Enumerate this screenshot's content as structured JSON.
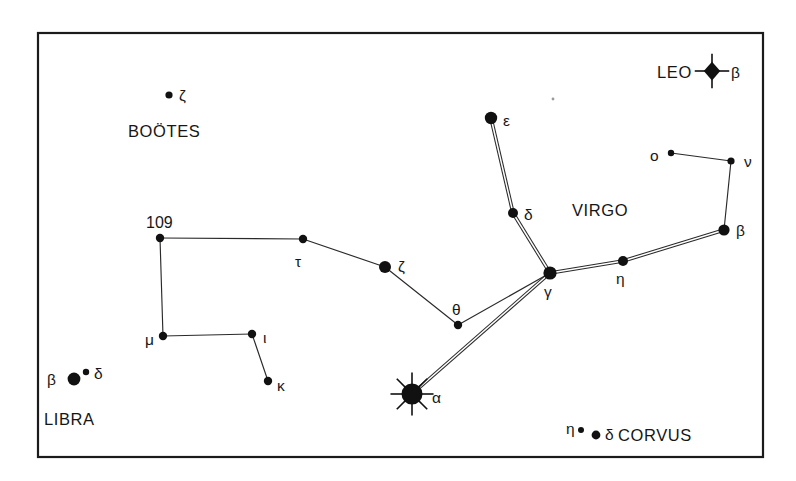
{
  "figure": {
    "kind": "star-chart",
    "title_visible": false,
    "background_color": "#ffffff",
    "frame": {
      "x": 38,
      "y": 33,
      "width": 725,
      "height": 424,
      "stroke_color": "#1b1b1b"
    },
    "ink_color": "#111111"
  },
  "constellation_labels": [
    {
      "id": "leo",
      "text": "LEO",
      "x": 657,
      "y": 78
    },
    {
      "id": "bootes",
      "text": "BOÖTES",
      "x": 128,
      "y": 137
    },
    {
      "id": "virgo",
      "text": "VIRGO",
      "x": 572,
      "y": 216
    },
    {
      "id": "libra",
      "text": "LIBRA",
      "x": 44,
      "y": 425
    },
    {
      "id": "corvus",
      "text": "CORVUS",
      "x": 618,
      "y": 441
    }
  ],
  "stars": [
    {
      "id": "leo-beta",
      "label": "β",
      "label_x": 731,
      "label_y": 78,
      "x": 712,
      "y": 71,
      "marker": "burst4",
      "r": 7.5
    },
    {
      "id": "bootes-zeta",
      "label": "ζ",
      "label_x": 179,
      "label_y": 101,
      "x": 169,
      "y": 95,
      "marker": "dot",
      "r": 3.6
    },
    {
      "id": "virgo-epsilon",
      "label": "ε",
      "label_x": 503,
      "label_y": 126,
      "x": 491,
      "y": 118,
      "marker": "dot",
      "r": 6.2
    },
    {
      "id": "virgo-omicron",
      "label": "ο",
      "label_x": 650,
      "label_y": 161,
      "x": 671,
      "y": 153,
      "marker": "dot",
      "r": 3.2
    },
    {
      "id": "virgo-nu",
      "label": "ν",
      "label_x": 744,
      "label_y": 167,
      "x": 731,
      "y": 161,
      "marker": "dot",
      "r": 3.6
    },
    {
      "id": "virgo-delta",
      "label": "δ",
      "label_x": 524,
      "label_y": 220,
      "x": 513,
      "y": 213,
      "marker": "dot",
      "r": 5.0
    },
    {
      "id": "virgo-beta",
      "label": "β",
      "label_x": 736,
      "label_y": 236,
      "x": 724,
      "y": 230,
      "marker": "dot",
      "r": 5.6
    },
    {
      "id": "bootes-109",
      "label": "109",
      "label_x": 146,
      "label_y": 228,
      "x": 160,
      "y": 238,
      "marker": "dot",
      "r": 4.2
    },
    {
      "id": "bootes-tau",
      "label": "τ",
      "label_x": 295,
      "label_y": 267,
      "x": 303,
      "y": 239,
      "marker": "dot",
      "r": 4.2
    },
    {
      "id": "bootes-zeta2",
      "label": "ζ",
      "label_x": 398,
      "label_y": 272,
      "x": 385,
      "y": 267,
      "marker": "dot",
      "r": 6.0
    },
    {
      "id": "virgo-gamma",
      "label": "γ",
      "label_x": 544,
      "label_y": 297,
      "x": 550,
      "y": 273,
      "marker": "dot",
      "r": 6.6
    },
    {
      "id": "virgo-eta",
      "label": "η",
      "label_x": 616,
      "label_y": 284,
      "x": 623,
      "y": 261,
      "marker": "dot",
      "r": 5.0
    },
    {
      "id": "bootes-theta",
      "label": "θ",
      "label_x": 452,
      "label_y": 315,
      "x": 458,
      "y": 325,
      "marker": "dot",
      "r": 4.2
    },
    {
      "id": "bootes-mu",
      "label": "μ",
      "label_x": 145,
      "label_y": 345,
      "x": 163,
      "y": 336,
      "marker": "dot",
      "r": 4.2
    },
    {
      "id": "bootes-iota",
      "label": "ι",
      "label_x": 263,
      "label_y": 343,
      "x": 252,
      "y": 334,
      "marker": "dot",
      "r": 4.2
    },
    {
      "id": "bootes-kappa",
      "label": "κ",
      "label_x": 277,
      "label_y": 391,
      "x": 268,
      "y": 381,
      "marker": "dot",
      "r": 4.2
    },
    {
      "id": "libra-beta",
      "label": "β",
      "label_x": 47,
      "label_y": 385,
      "x": 74,
      "y": 379,
      "marker": "dot",
      "r": 6.4
    },
    {
      "id": "libra-delta",
      "label": "δ",
      "label_x": 94,
      "label_y": 379,
      "x": 86,
      "y": 372,
      "marker": "dot",
      "r": 3.2
    },
    {
      "id": "virgo-alpha",
      "label": "α",
      "label_x": 432,
      "label_y": 403,
      "x": 412,
      "y": 394,
      "marker": "burst8",
      "r": 10.5
    },
    {
      "id": "corvus-eta",
      "label": "η",
      "label_x": 566,
      "label_y": 434,
      "x": 581,
      "y": 430,
      "marker": "dot",
      "r": 3.0
    },
    {
      "id": "corvus-delta",
      "label": "δ",
      "label_x": 605,
      "label_y": 440,
      "x": 596,
      "y": 435,
      "marker": "dot",
      "r": 4.4
    }
  ],
  "links": [
    {
      "id": "epsilon-delta",
      "from": "virgo-epsilon",
      "to": "virgo-delta",
      "style": "double"
    },
    {
      "id": "delta-gamma",
      "from": "virgo-delta",
      "to": "virgo-gamma",
      "style": "double"
    },
    {
      "id": "gamma-eta",
      "from": "virgo-gamma",
      "to": "virgo-eta",
      "style": "double"
    },
    {
      "id": "eta-beta",
      "from": "virgo-eta",
      "to": "virgo-beta",
      "style": "double"
    },
    {
      "id": "gamma-alpha",
      "from": "virgo-gamma",
      "to": "virgo-alpha",
      "style": "double"
    },
    {
      "id": "omicron-nu",
      "from": "virgo-omicron",
      "to": "virgo-nu",
      "style": "single"
    },
    {
      "id": "nu-beta",
      "from": "virgo-nu",
      "to": "virgo-beta",
      "style": "single"
    },
    {
      "id": "109-tau",
      "from": "bootes-109",
      "to": "bootes-tau",
      "style": "single"
    },
    {
      "id": "tau-zeta",
      "from": "bootes-tau",
      "to": "bootes-zeta2",
      "style": "single"
    },
    {
      "id": "zeta-theta",
      "from": "bootes-zeta2",
      "to": "bootes-theta",
      "style": "single"
    },
    {
      "id": "theta-gamma",
      "from": "bootes-theta",
      "to": "virgo-gamma",
      "style": "single"
    },
    {
      "id": "109-mu",
      "from": "bootes-109",
      "to": "bootes-mu",
      "style": "single"
    },
    {
      "id": "mu-iota",
      "from": "bootes-mu",
      "to": "bootes-iota",
      "style": "single"
    },
    {
      "id": "iota-kappa",
      "from": "bootes-iota",
      "to": "bootes-kappa",
      "style": "single"
    }
  ],
  "artifacts": [
    {
      "id": "dust-speck",
      "x": 553,
      "y": 99,
      "r": 1.4
    }
  ]
}
